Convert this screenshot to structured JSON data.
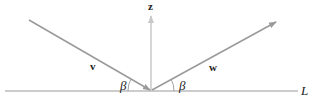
{
  "diagram": {
    "labels": {
      "z": "z",
      "v": "v",
      "w": "w",
      "beta_left": "β",
      "beta_right": "β",
      "line": "L"
    },
    "colors": {
      "line": "#9a9a9a",
      "z_vector": "#c8c8c8",
      "text": "#222222"
    }
  }
}
